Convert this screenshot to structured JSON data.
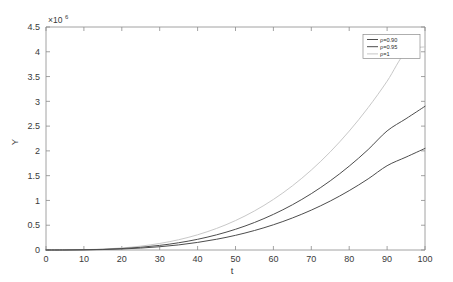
{
  "chart_data": {
    "type": "line",
    "title": "",
    "xlabel": "t",
    "ylabel": "Y",
    "y_exponent_label": "×10",
    "y_exponent_power": "6",
    "y_scale": 1000000,
    "xlim": [
      0,
      100
    ],
    "ylim": [
      0,
      4500000
    ],
    "grid": false,
    "legend_position": "top-right",
    "xticks": [
      0,
      10,
      20,
      30,
      40,
      50,
      60,
      70,
      80,
      90,
      100
    ],
    "xticklabels": [
      "0",
      "10",
      "20",
      "30",
      "40",
      "50",
      "60",
      "70",
      "80",
      "90",
      "100"
    ],
    "yticks": [
      0,
      500000,
      1000000,
      1500000,
      2000000,
      2500000,
      3000000,
      3500000,
      4000000,
      4500000
    ],
    "yticklabels": [
      "0",
      "0.5",
      "1",
      "1.5",
      "2",
      "2.5",
      "3",
      "3.5",
      "4",
      "4.5"
    ],
    "x": [
      0,
      5,
      10,
      15,
      20,
      25,
      30,
      35,
      40,
      45,
      50,
      55,
      60,
      65,
      70,
      75,
      80,
      85,
      90,
      95,
      100
    ],
    "series": [
      {
        "name": "ρ=1",
        "color": "#c8c8c8",
        "linewidth": 1.0,
        "values": [
          0,
          1000,
          6000,
          18000,
          41000,
          78000,
          132000,
          207000,
          307000,
          435000,
          594000,
          788000,
          1020000,
          1294000,
          1613000,
          1980000,
          2399000,
          2873000,
          3406000,
          4000000,
          4100000
        ]
      },
      {
        "name": "ρ=0.95",
        "color": "#4d4d4d",
        "linewidth": 1.0,
        "values": [
          0,
          800,
          4400,
          13000,
          29000,
          55000,
          93000,
          146000,
          216000,
          306000,
          418000,
          555000,
          719000,
          912000,
          1137000,
          1396000,
          1692000,
          2027000,
          2403000,
          2650000,
          2900000
        ]
      },
      {
        "name": "ρ=0.90",
        "color": "#4d4d4d",
        "linewidth": 1.0,
        "values": [
          0,
          600,
          3200,
          9200,
          20500,
          39000,
          66000,
          103000,
          153000,
          217000,
          296000,
          393000,
          509000,
          646000,
          805000,
          988000,
          1198000,
          1435000,
          1701000,
          1875000,
          2050000
        ]
      }
    ],
    "legend_entries": [
      {
        "label": "ρ=0.90",
        "color": "#4d4d4d"
      },
      {
        "label": "ρ=0.95",
        "color": "#4d4d4d"
      },
      {
        "label": "ρ=1",
        "color": "#c8c8c8"
      }
    ]
  }
}
